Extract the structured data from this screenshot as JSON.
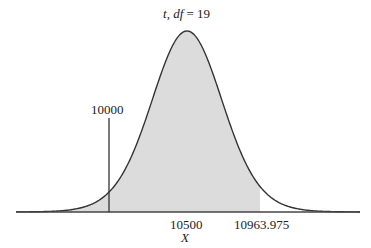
{
  "chart_data": {
    "type": "area",
    "title": "t, df = 19",
    "title_parts": {
      "t": "t",
      "sep": ", ",
      "df": "df",
      "eq": " = 19"
    },
    "distribution": "Student t",
    "df": 19,
    "center": 10500,
    "xlabel": "X",
    "ylabel": "",
    "tick_labels": [
      "10500",
      "10963.975"
    ],
    "annotations": [
      {
        "label": "10000",
        "x": 10000,
        "type": "vertical-line"
      }
    ],
    "shaded_region": {
      "from": "-inf",
      "to": 10963.975,
      "color": "#dcdcdc"
    },
    "critical_value": 10963.975,
    "hypothesized_value": 10000,
    "grid": false,
    "legend": null
  },
  "labels": {
    "title_t": "t",
    "title_rest_df": "df",
    "title_eq": " = 19",
    "marker_10000": "10000",
    "tick_10500": "10500",
    "tick_10963": "10963.975",
    "x_axis": "X"
  },
  "colors": {
    "curve": "#333333",
    "shade": "#dcdcdc",
    "axis": "#444444"
  }
}
